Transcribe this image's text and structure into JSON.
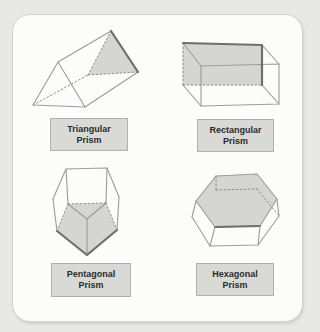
{
  "figures": {
    "triangular": {
      "line1": "Triangular",
      "line2": "Prism"
    },
    "rectangular": {
      "line1": "Rectangular",
      "line2": "Prism"
    },
    "pentagonal": {
      "line1": "Pentagonal",
      "line2": "Prism"
    },
    "hexagonal": {
      "line1": "Hexagonal",
      "line2": "Prism"
    }
  },
  "colors": {
    "page_background": "#e8e8e6",
    "card_background": "#fcfcfb",
    "shaded_face": "#d5d5d1",
    "label_background": "#d9d9d6",
    "label_border": "#b0b0ad",
    "edge": "#9b9b98",
    "edge_dark": "#6e6e6b",
    "text": "#2b2b2b"
  }
}
